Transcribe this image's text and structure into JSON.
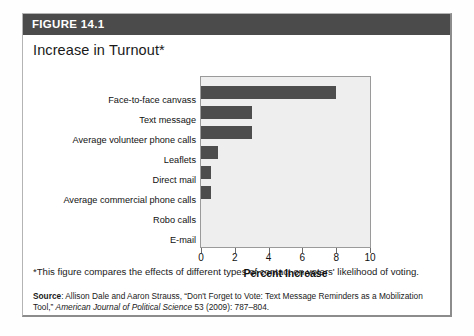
{
  "figure": {
    "header_label": "FIGURE 14.1",
    "title": "Increase in Turnout*",
    "footnote": "*This figure compares the effects of different types of contact on voters' likelihood of voting.",
    "source_prefix": "Source",
    "source_separator": ": ",
    "source_text": "Allison Dale and Aaron Strauss, “Don't Forget to Vote: Text Message Reminders as a Mobilization Tool,” ",
    "source_journal": "American Journal of Political Science",
    "source_citation": " 53 (2009): 787–804."
  },
  "colors": {
    "header_band": "#4b4b4b",
    "bar_fill": "#4d4d4d",
    "plot_background": "#eeeeee",
    "plot_border": "#9a9a9a",
    "box_border": "#b4b4b4",
    "text": "#1a1a1a"
  },
  "chart_data": {
    "type": "bar",
    "orientation": "horizontal",
    "title": "Increase in Turnout*",
    "xlabel": "Percent Increase",
    "ylabel": "",
    "xlim": [
      0,
      10
    ],
    "xticks": [
      0,
      2,
      4,
      6,
      8,
      10
    ],
    "xticklabels": [
      "0",
      "2",
      "4",
      "6",
      "8",
      "10"
    ],
    "grid": false,
    "legend": false,
    "categories": [
      "Face-to-face canvass",
      "Text message",
      "Average volunteer phone calls",
      "Leaflets",
      "Direct mail",
      "Average commercial phone calls",
      "Robo calls",
      "E-mail"
    ],
    "values": [
      8.0,
      3.0,
      3.0,
      1.0,
      0.6,
      0.6,
      0.0,
      0.0
    ]
  }
}
